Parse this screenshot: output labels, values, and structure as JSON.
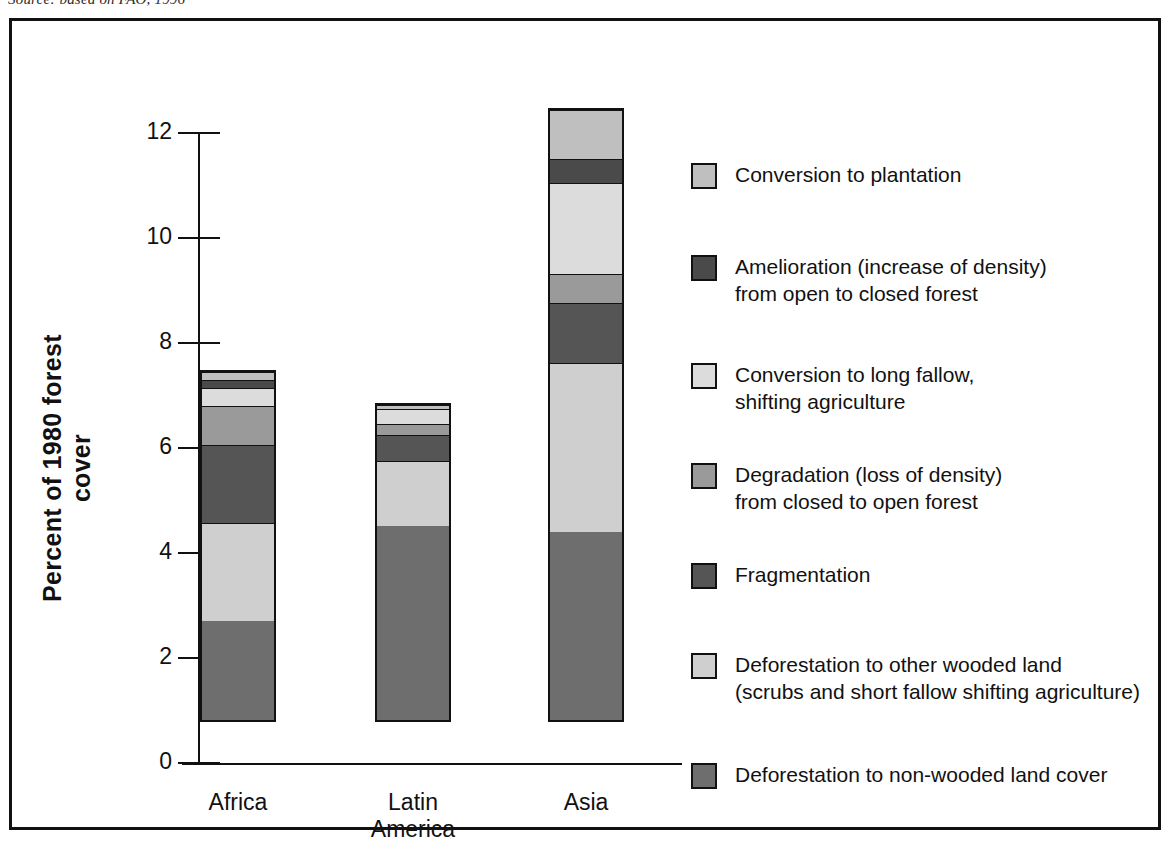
{
  "caption": {
    "source": "Source: based on FAO, 1996"
  },
  "chart_data": {
    "type": "bar",
    "stacked": true,
    "title": "",
    "xlabel": "",
    "ylabel": "Percent of 1980 forest cover",
    "ylim": [
      0,
      12
    ],
    "yticks": [
      0,
      2,
      4,
      6,
      8,
      10,
      12
    ],
    "ytick_labels": [
      "0",
      "2",
      "4",
      "6",
      "8",
      "10",
      "12"
    ],
    "grid": false,
    "legend_position": "right",
    "categories": [
      "Africa",
      "Latin\nAmerica",
      "Asia"
    ],
    "category_labels": [
      "Africa",
      "Latin America",
      "Asia"
    ],
    "series": [
      {
        "name": "Deforestation to non-wooded land cover",
        "color": "#6e6e6e",
        "values": [
          1.9,
          3.75,
          3.6
        ]
      },
      {
        "name": "Deforestation to other wooded land (scrubs and short fallow shifting agriculture)",
        "color": "#cfcfcf",
        "values": [
          1.9,
          1.25,
          3.25
        ]
      },
      {
        "name": "Fragmentation",
        "color": "#555555",
        "values": [
          1.5,
          0.5,
          1.15
        ]
      },
      {
        "name": "Degradation (loss of density) from closed to open forest",
        "color": "#9a9a9a",
        "values": [
          0.75,
          0.22,
          0.55
        ]
      },
      {
        "name": "Conversion to long fallow, shifting agriculture",
        "color": "#dcdcdc",
        "values": [
          0.35,
          0.28,
          1.75
        ]
      },
      {
        "name": "Amelioration (increase of density) from open to closed forest",
        "color": "#4a4a4a",
        "values": [
          0.15,
          0.0,
          0.45
        ]
      },
      {
        "name": "Conversion to plantation",
        "color": "#bfbfbf",
        "values": [
          0.15,
          0.07,
          0.95
        ]
      }
    ],
    "totals": [
      6.7,
      6.07,
      11.7
    ]
  },
  "legend": {
    "items": [
      {
        "label": "Conversion to plantation",
        "color": "#bfbfbf"
      },
      {
        "label": "Amelioration (increase of density)\nfrom open to closed forest",
        "color": "#4a4a4a"
      },
      {
        "label": "Conversion to long fallow,\nshifting agriculture",
        "color": "#dcdcdc"
      },
      {
        "label": "Degradation (loss of density)\nfrom closed to open forest",
        "color": "#9a9a9a"
      },
      {
        "label": "Fragmentation",
        "color": "#555555"
      },
      {
        "label": "Deforestation to other wooded land\n(scrubs and short fallow shifting agriculture)",
        "color": "#cfcfcf"
      },
      {
        "label": "Deforestation to non-wooded land cover",
        "color": "#6e6e6e"
      }
    ]
  },
  "axis": {
    "title": "Percent of 1980 forest cover"
  }
}
